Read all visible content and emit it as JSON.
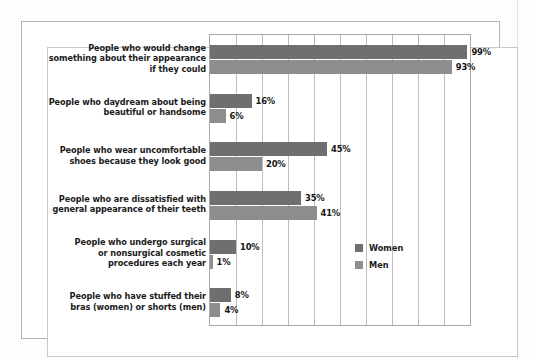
{
  "chart_data": {
    "type": "bar",
    "orientation": "horizontal",
    "title": "",
    "subtitle": "",
    "xlabel": "",
    "ylabel": "",
    "xlim": [
      0,
      100
    ],
    "xtick_step": 10,
    "xticks": [
      0,
      10,
      20,
      30,
      40,
      50,
      60,
      70,
      80,
      90,
      100
    ],
    "xtick_labels_shown": false,
    "grid": true,
    "grid_axis": "x",
    "legend_position": "inside-lower-right",
    "value_label_suffix": "%",
    "categories": [
      "People who would change something about their appearance if they could",
      "People who daydream about being beautiful or handsome",
      "People who wear uncomfortable shoes because they look good",
      "People who are dissatisfied with general appearance of their teeth",
      "People who undergo surgical or nonsurgical cosmetic procedures each year",
      "People who have stuffed their bras (women) or shorts (men)"
    ],
    "category_lines": [
      [
        "People who would change",
        "something about their appearance",
        "if they could"
      ],
      [
        "People who daydream about being",
        "beautiful or handsome"
      ],
      [
        "People who wear uncomfortable",
        "shoes because they look good"
      ],
      [
        "People who are dissatisfied with",
        "general appearance of their teeth"
      ],
      [
        "People who undergo surgical",
        "or nonsurgical cosmetic",
        "procedures each year"
      ],
      [
        "People who have stuffed their",
        "bras (women) or shorts (men)"
      ]
    ],
    "series": [
      {
        "name": "Women",
        "color": "#6f6f6f",
        "values": [
          99,
          16,
          45,
          35,
          10,
          8
        ],
        "value_labels": [
          "99%",
          "16%",
          "45%",
          "35%",
          "10%",
          "8%"
        ]
      },
      {
        "name": "Men",
        "color": "#8d8d8d",
        "values": [
          93,
          6,
          20,
          41,
          1,
          4
        ],
        "value_labels": [
          "93%",
          "6%",
          "20%",
          "41%",
          "1%",
          "4%"
        ]
      }
    ]
  },
  "legend": {
    "items": [
      {
        "label": "Women",
        "color": "#6f6f6f"
      },
      {
        "label": "Men",
        "color": "#8d8d8d"
      }
    ]
  }
}
